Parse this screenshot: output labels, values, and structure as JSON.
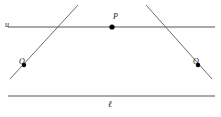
{
  "figure": {
    "type": "geometry-diagram",
    "background_color": "#ffffff",
    "width": 221,
    "height": 117,
    "line_color": "#8c8c8c",
    "ray_color": "#5a5a5a",
    "point_color": "#000000",
    "label_color": "#1a1a1a",
    "labels": {
      "top_line": "u",
      "bottom_line": "ℓ",
      "intersection_point": "P",
      "left_point": "Q",
      "right_point": "Q"
    },
    "horizontal_lines": [
      {
        "name": "u",
        "x1": 8,
        "y1": 27,
        "x2": 215,
        "y2": 27
      },
      {
        "name": "ℓ",
        "x1": 8,
        "y1": 96,
        "x2": 215,
        "y2": 96
      }
    ],
    "transversals": [
      {
        "name": "ray-through-Q-left",
        "x1": 78,
        "y1": 5,
        "x2": 10,
        "y2": 79
      },
      {
        "name": "ray-through-Q-right",
        "x1": 146,
        "y1": 5,
        "x2": 212,
        "y2": 79
      }
    ],
    "points": [
      {
        "name": "P",
        "x": 112,
        "y": 27,
        "radius": 2.6
      },
      {
        "name": "Q-left",
        "x": 24,
        "y": 65,
        "radius": 2.2
      },
      {
        "name": "Q-right",
        "x": 198,
        "y": 65,
        "radius": 2.2
      }
    ]
  }
}
